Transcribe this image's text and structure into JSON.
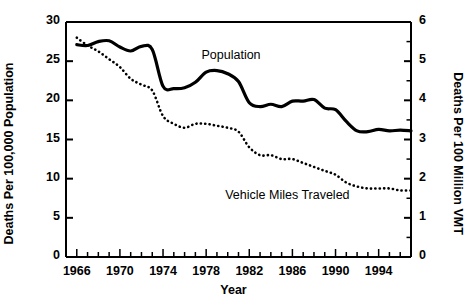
{
  "chart_data": {
    "type": "line",
    "title": "",
    "xlabel": "Year",
    "ylabel": "Deaths Per 100,000 Population",
    "ylabel_right": "Deaths Per 100 Million VMT",
    "grid": false,
    "legend_position": "inline-annotation",
    "xlim": [
      1965,
      1997
    ],
    "ylim": [
      0,
      30
    ],
    "ylim_right": [
      0,
      6
    ],
    "xticks_major": [
      1966,
      1970,
      1974,
      1978,
      1982,
      1986,
      1990,
      1994
    ],
    "xticks_major_labels": [
      "1966",
      "1970",
      "1974",
      "1978",
      "1982",
      "1986",
      "1990",
      "1994"
    ],
    "xticks_minor_step": 1,
    "yticks_left": [
      0,
      5,
      10,
      15,
      20,
      25,
      30
    ],
    "yticks_left_labels": [
      "0",
      "5",
      "10",
      "15",
      "20",
      "25",
      "30"
    ],
    "yticks_right": [
      0,
      1,
      2,
      3,
      4,
      5,
      6
    ],
    "yticks_right_labels": [
      "0",
      "1",
      "2",
      "3",
      "4",
      "5",
      "6"
    ],
    "yticks_right_minor_step": 0.5,
    "x": [
      1966,
      1967,
      1968,
      1969,
      1970,
      1971,
      1972,
      1973,
      1974,
      1975,
      1976,
      1977,
      1978,
      1979,
      1980,
      1981,
      1982,
      1983,
      1984,
      1985,
      1986,
      1987,
      1988,
      1989,
      1990,
      1991,
      1992,
      1993,
      1994,
      1995,
      1996,
      1997
    ],
    "series": [
      {
        "name": "Population",
        "axis": "left",
        "style": "solid",
        "color": "#000000",
        "units": "Deaths Per 100,000 Population",
        "values": [
          27.1,
          27.0,
          27.5,
          27.6,
          26.8,
          26.3,
          26.9,
          26.5,
          21.8,
          21.5,
          21.6,
          22.3,
          23.6,
          23.8,
          23.4,
          22.4,
          19.7,
          19.2,
          19.5,
          19.2,
          19.9,
          19.9,
          20.1,
          19.0,
          18.8,
          17.3,
          16.1,
          16.0,
          16.3,
          16.1,
          16.2,
          16.1
        ]
      },
      {
        "name": "Vehicle Miles Traveled",
        "axis": "right",
        "style": "dotted",
        "color": "#000000",
        "units": "Deaths Per 100 Million VMT",
        "values": [
          5.6,
          5.4,
          5.25,
          5.05,
          4.85,
          4.55,
          4.4,
          4.25,
          3.6,
          3.4,
          3.3,
          3.4,
          3.4,
          3.35,
          3.3,
          3.2,
          2.8,
          2.6,
          2.6,
          2.5,
          2.5,
          2.4,
          2.3,
          2.2,
          2.1,
          1.9,
          1.8,
          1.75,
          1.75,
          1.75,
          1.7,
          1.7
        ]
      }
    ],
    "annotations": [
      {
        "text": "Population",
        "x": 1981,
        "y": 25.5,
        "series": "Population"
      },
      {
        "text": "Vehicle Miles Traveled",
        "x": 1987,
        "y": 7.6,
        "series": "Vehicle Miles Traveled"
      }
    ]
  }
}
